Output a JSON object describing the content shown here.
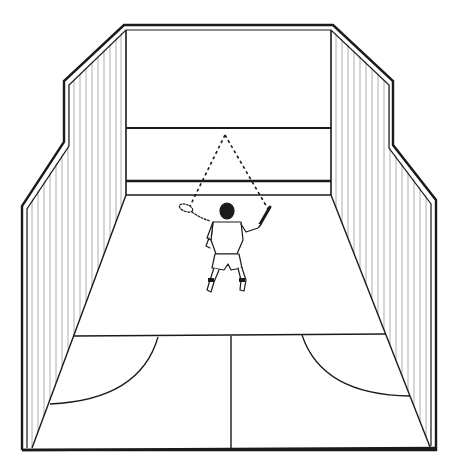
{
  "figure": {
    "colors": {
      "background": "#ffffff",
      "ink": "#1a1a1a",
      "hatch": "#9a9a9a"
    },
    "elements": {
      "front_wall": {
        "label": "front-wall"
      },
      "service_line": {
        "label": "service-line"
      },
      "tin_line": {
        "label": "tin-board-line"
      },
      "left_side_wall": {
        "label": "left-side-wall"
      },
      "right_side_wall": {
        "label": "right-side-wall"
      },
      "short_line": {
        "label": "short-line"
      },
      "half_court_line": {
        "label": "half-court-line"
      },
      "left_service_box": {
        "label": "left-service-box-arc"
      },
      "right_service_box": {
        "label": "right-service-box-arc"
      },
      "player": {
        "label": "player-ready-stance"
      },
      "ball_path": {
        "label": "dashed-ball-trajectory-triangle"
      }
    }
  }
}
